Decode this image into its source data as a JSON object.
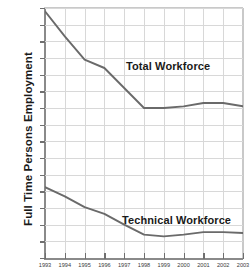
{
  "chart_data": {
    "type": "line",
    "title": "",
    "xlabel": "",
    "ylabel": "Full Time Persons Employment",
    "x": [
      1993,
      1994,
      1995,
      1996,
      1997,
      1998,
      1999,
      2000,
      2001,
      2002,
      2003
    ],
    "xtick_labels": [
      "1993",
      "1994",
      "1995",
      "1996",
      "1997",
      "1998",
      "1999",
      "2000",
      "2001",
      "2002",
      "2003"
    ],
    "ylim": [
      9000,
      24000
    ],
    "ytick_values": [
      9000,
      10000,
      11000,
      12000,
      13000,
      14000,
      15000,
      16000,
      17000,
      18000,
      19000,
      20000,
      21000,
      22000,
      23000,
      24000
    ],
    "ytick_labels": [
      "9,000",
      "10,000",
      "11,000",
      "12,000",
      "13,000",
      "14,000",
      "15,000",
      "16,000",
      "17,000",
      "18,000",
      "19,000",
      "20,000",
      "21,000",
      "22,000",
      "23,000",
      "24,000"
    ],
    "grid": true,
    "legend_position": "inline-annotation",
    "series": [
      {
        "name": "Total Workforce",
        "color": "#6a6a6a",
        "values": [
          23800,
          22300,
          20900,
          20400,
          19200,
          18000,
          18000,
          18100,
          18300,
          18300,
          18100
        ]
      },
      {
        "name": "Technical Workforce",
        "color": "#6a6a6a",
        "values": [
          13250,
          12700,
          12050,
          11650,
          11000,
          10400,
          10300,
          10400,
          10550,
          10550,
          10500
        ]
      }
    ],
    "annotations": [
      {
        "text": "Total Workforce",
        "series": "Total Workforce"
      },
      {
        "text": "Technical Workforce",
        "series": "Technical Workforce"
      }
    ]
  },
  "axis": {
    "y_title": "Full Time Persons Employment"
  }
}
